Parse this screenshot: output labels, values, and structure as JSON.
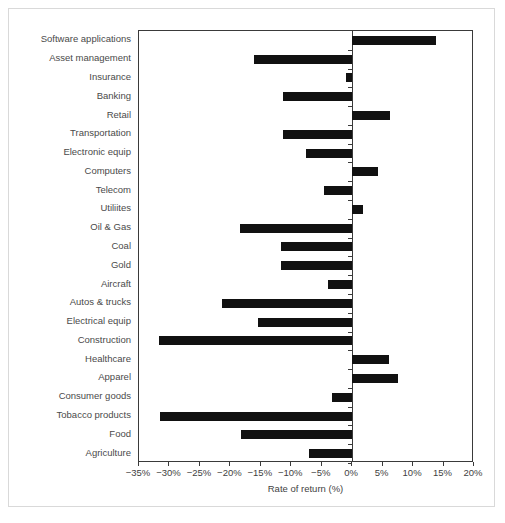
{
  "chart_data": {
    "type": "bar",
    "orientation": "horizontal",
    "title": "",
    "subtitle": "",
    "xlabel": "Rate of return (%)",
    "ylabel": "",
    "xlim": [
      -35,
      20
    ],
    "xticks": [
      -35,
      -30,
      -25,
      -20,
      -15,
      -10,
      -5,
      0,
      5,
      10,
      15,
      20
    ],
    "xtick_labels": [
      "−35%",
      "−30%",
      "−25%",
      "−20%",
      "−15%",
      "−10%",
      "−5%",
      "0%",
      "5%",
      "10%",
      "15%",
      "20%"
    ],
    "grid": false,
    "legend": false,
    "legend_position": "none",
    "bar_color": "#111111",
    "axis_color": "#3a3a3a",
    "label_color": "#4a4a4a",
    "categories": [
      "Software applications",
      "Asset management",
      "Insurance",
      "Banking",
      "Retail",
      "Transportation",
      "Electronic equip",
      "Computers",
      "Telecom",
      "Utiliites",
      "Oil  & Gas",
      "Coal",
      "Gold",
      "Aircraft",
      "Autos & trucks",
      "Electrical equip",
      "Construction",
      "Healthcare",
      "Apparel",
      "Consumer goods",
      "Tobacco products",
      "Food",
      "Agriculture"
    ],
    "values": [
      13.7,
      -16.2,
      -1.0,
      -11.4,
      6.2,
      -11.4,
      -7.6,
      4.2,
      -4.6,
      1.7,
      -18.4,
      -11.7,
      -11.7,
      -3.9,
      -21.4,
      -15.4,
      -31.7,
      6.0,
      7.5,
      -3.3,
      -31.5,
      -18.3,
      -7.1
    ]
  }
}
